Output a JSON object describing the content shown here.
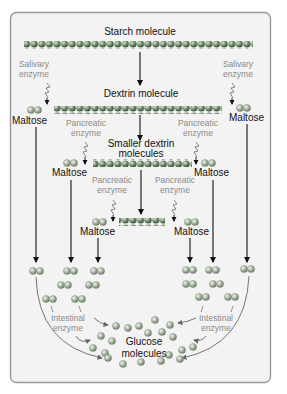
{
  "diagram": {
    "labels": {
      "starch": "Starch molecule",
      "dextrin": "Dextrin molecule",
      "smaller_dextrin_line1": "Smaller dextrin",
      "smaller_dextrin_line2": "molecules",
      "glucose_line1": "Glucose",
      "glucose_line2": "molecules",
      "maltose": "Maltose"
    },
    "enzymes": {
      "salivary_line1": "Salivary",
      "salivary_line2": "enzyme",
      "pancreatic_line1": "Pancreatic",
      "pancreatic_line2": "enzyme",
      "intestinal_line1": "Intestinal",
      "intestinal_line2": "enzyme"
    },
    "colors": {
      "panel_fill": "#f3f3f3",
      "panel_border": "#9a9a9a",
      "starch_bead": "#6f8f6a",
      "maltose_bead": "#a9b7a3",
      "glucose_bead": "#9fae98",
      "arrow": "#111111",
      "enzyme_text": "#8a8a8a",
      "curve_arrow": "#777777"
    }
  }
}
